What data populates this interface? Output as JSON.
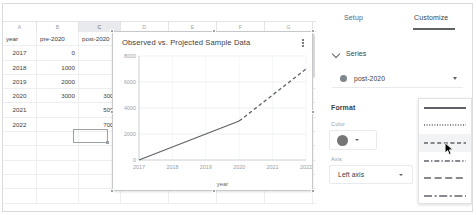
{
  "spreadsheet": {
    "column_headers": [
      "A",
      "B",
      "C",
      "D",
      "E",
      "F",
      "G"
    ],
    "selected_column": "C",
    "header_row": [
      "year",
      "pre-2020",
      "post-2020"
    ],
    "rows": [
      {
        "year": "2017",
        "pre": "0",
        "post": ""
      },
      {
        "year": "2018",
        "pre": "1000",
        "post": ""
      },
      {
        "year": "2019",
        "pre": "2000",
        "post": ""
      },
      {
        "year": "2020",
        "pre": "3000",
        "post": "3000"
      },
      {
        "year": "2021",
        "pre": "",
        "post": "5000"
      },
      {
        "year": "2022",
        "pre": "",
        "post": "7000"
      }
    ],
    "selected_cell_value": ""
  },
  "chart": {
    "title": "Observed vs. Projected Sample Data",
    "menu_icon": "kebab-menu-icon"
  },
  "chart_data": {
    "type": "line",
    "title": "Observed vs. Projected Sample Data",
    "xlabel": "year",
    "ylabel": "",
    "x": [
      2017,
      2018,
      2019,
      2020,
      2021,
      2022
    ],
    "xtick_labels": [
      "2017",
      "2018",
      "2019",
      "2020",
      "2021",
      "2022"
    ],
    "ytick_labels": [
      "0",
      "2000",
      "4000",
      "6000",
      "8000"
    ],
    "ylim": [
      0,
      8000
    ],
    "xlim": [
      2017,
      2022
    ],
    "grid": true,
    "legend": "none",
    "series": [
      {
        "name": "pre-2020",
        "style": "solid",
        "color": "#5f6368",
        "x": [
          2017,
          2018,
          2019,
          2020
        ],
        "values": [
          0,
          1000,
          2000,
          3000
        ]
      },
      {
        "name": "post-2020",
        "style": "dashed",
        "color": "#5f6368",
        "x": [
          2020,
          2021,
          2022
        ],
        "values": [
          3000,
          5000,
          7000
        ]
      }
    ]
  },
  "panel": {
    "tabs": [
      {
        "label": "Setup",
        "active": false
      },
      {
        "label": "Customize",
        "active": true
      }
    ],
    "section_title": "Series",
    "series_selected": "post-2020",
    "series_dot_color": "#80868b",
    "format_label": "Format",
    "color_label": "Color",
    "color_value": "#767676",
    "axis_label": "Axis",
    "axis_value": "Left axis",
    "line_styles": [
      {
        "name": "solid",
        "dash": "none",
        "hover": false
      },
      {
        "name": "dotted",
        "dash": "1,1.6",
        "hover": false
      },
      {
        "name": "dashed-short",
        "dash": "4,2.6",
        "hover": true
      },
      {
        "name": "dash-dot",
        "dash": "5,2,1.4,2",
        "hover": false
      },
      {
        "name": "dashed-long",
        "dash": "7,3.6",
        "hover": false
      },
      {
        "name": "long-dash-dot",
        "dash": "8,2.6,2,2.6",
        "hover": false
      }
    ]
  }
}
